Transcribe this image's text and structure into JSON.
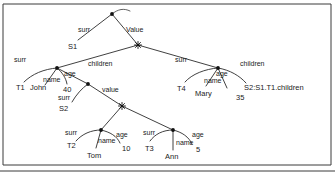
{
  "figure": {
    "type": "graph-diagram",
    "title": "",
    "background": "#ffffff",
    "ink_color": "#1a1a1a",
    "frame": {
      "top_y": 4,
      "left_x": 3,
      "right_x": 331,
      "bottom_y": 165,
      "baseline_y": 171
    }
  },
  "nodes": [
    {
      "id": "root",
      "kind": "dot",
      "x": 112,
      "y": 14,
      "label": ""
    },
    {
      "id": "star1",
      "kind": "star",
      "x": 138,
      "y": 45,
      "label": ""
    },
    {
      "id": "n_t1",
      "kind": "dot",
      "x": 57,
      "y": 68,
      "label": ""
    },
    {
      "id": "n_t4",
      "kind": "dot",
      "x": 218,
      "y": 68,
      "label": ""
    },
    {
      "id": "n_s2",
      "kind": "dot",
      "x": 88,
      "y": 84,
      "label": ""
    },
    {
      "id": "star2",
      "kind": "star",
      "x": 122,
      "y": 106,
      "label": ""
    },
    {
      "id": "n_t2",
      "kind": "dot",
      "x": 101,
      "y": 130,
      "label": ""
    },
    {
      "id": "n_t3",
      "kind": "dot",
      "x": 173,
      "y": 130,
      "label": ""
    }
  ],
  "edge_labels": {
    "root_surr": "surr",
    "root_value": "Value",
    "t1_surr": "surr",
    "t1_name": "name",
    "t1_age": "age",
    "t1_children": "children",
    "t4_surr": "surr",
    "t4_name": "name",
    "t4_age": "age",
    "t4_children": "children",
    "s2_surr": "surr",
    "s2_value": "value",
    "t2_surr": "surr",
    "t2_name": "name",
    "t2_age": "age",
    "t3_surr": "surr",
    "t3_name": "name",
    "t3_age": "age"
  },
  "leaves": {
    "s1": "S1",
    "t1": "T1",
    "john": "John",
    "age40": "40",
    "t4": "T4",
    "mary": "Mary",
    "age35": "35",
    "s2_children_ref": "S2:S1.T1.children",
    "s2": "S2",
    "t2": "T2",
    "tom": "Tom",
    "age10": "10",
    "t3": "T3",
    "ann": "Ann",
    "age5": "5"
  }
}
